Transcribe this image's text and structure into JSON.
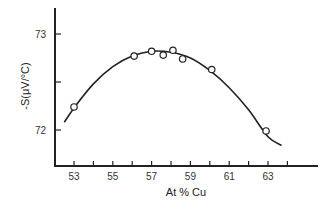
{
  "chart_data": {
    "type": "scatter",
    "title": "",
    "xlabel": "At % Cu",
    "ylabel": "-S(μV/°C)",
    "xlim": [
      52.1,
      65.6
    ],
    "ylim": [
      71.63,
      73.27
    ],
    "x_ticks": [
      53,
      54,
      55,
      56,
      57,
      58,
      59,
      60,
      61,
      62,
      63,
      64
    ],
    "x_tick_labels": [
      "53",
      "55",
      "57",
      "59",
      "61",
      "63"
    ],
    "x_tick_label_values": [
      53,
      55,
      57,
      59,
      61,
      63
    ],
    "y_ticks": [
      72,
      72.5,
      73
    ],
    "y_tick_labels": [
      "72",
      "73"
    ],
    "y_tick_label_values": [
      72,
      73
    ],
    "grid": false,
    "legend": null,
    "series": [
      {
        "name": "measured",
        "marker": "open-circle",
        "x": [
          53.0,
          56.1,
          57.0,
          57.6,
          58.1,
          58.6,
          60.1,
          62.9
        ],
        "y": [
          72.24,
          72.77,
          72.82,
          72.78,
          72.83,
          72.74,
          72.63,
          71.99
        ]
      },
      {
        "name": "fitted-curve",
        "style": "line",
        "x": [
          52.5,
          53.0,
          54.0,
          55.0,
          56.0,
          57.0,
          58.0,
          59.0,
          60.0,
          61.0,
          62.0,
          63.0,
          63.7
        ],
        "y": [
          72.08,
          72.23,
          72.48,
          72.66,
          72.77,
          72.82,
          72.81,
          72.75,
          72.62,
          72.44,
          72.21,
          71.93,
          71.84
        ]
      }
    ]
  }
}
